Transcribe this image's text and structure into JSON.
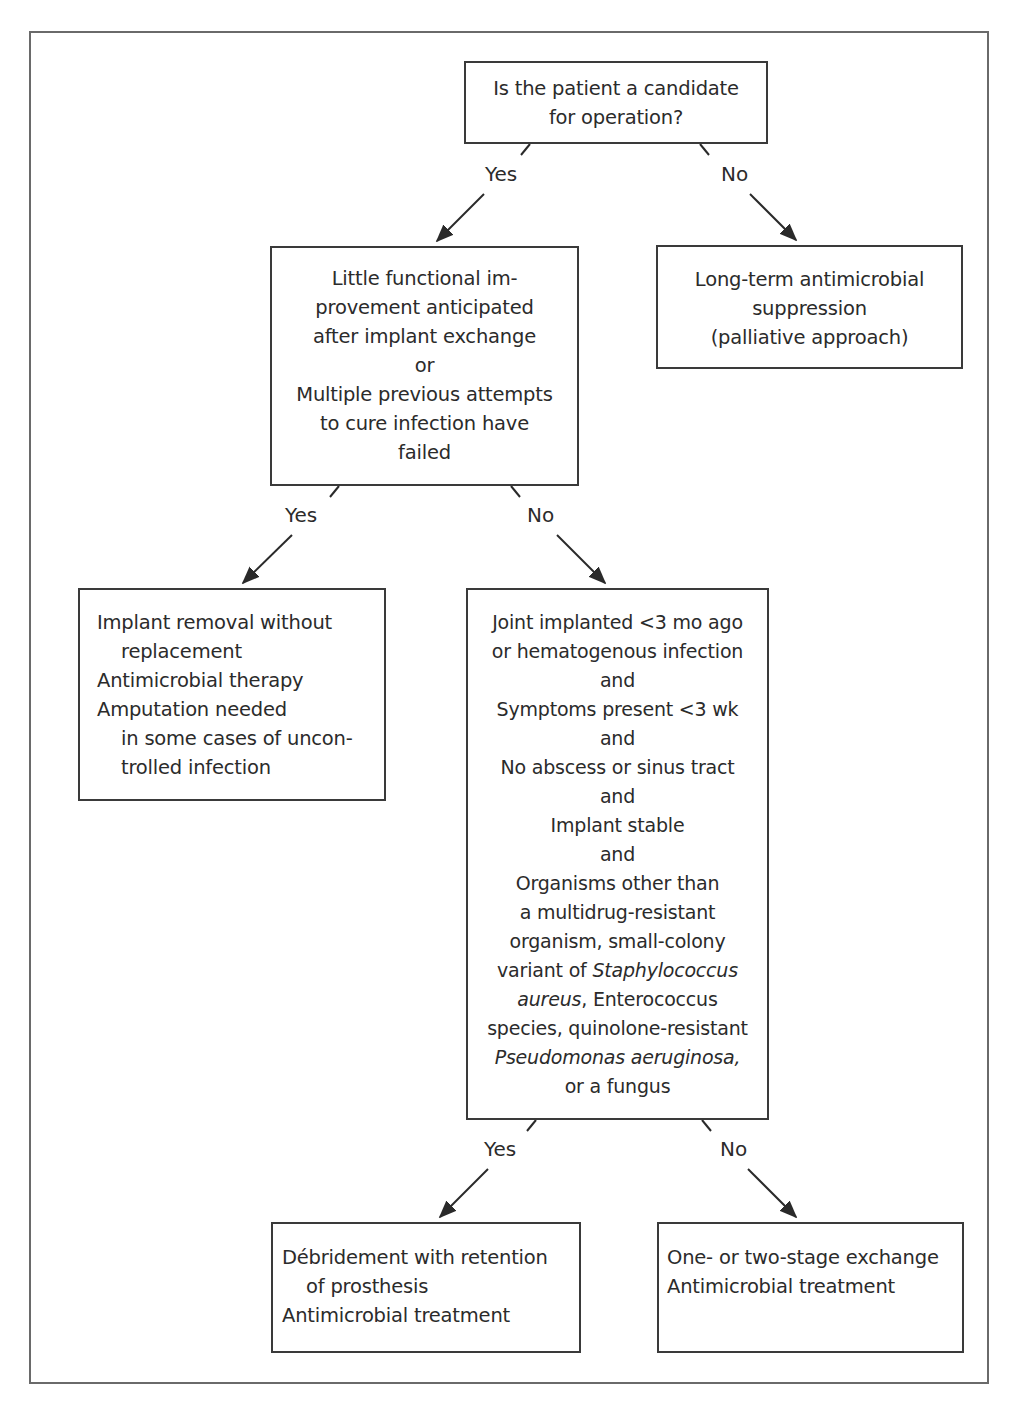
{
  "diagram": {
    "type": "decision-flowchart",
    "nodes": {
      "start": {
        "lines": [
          "Is the patient a candidate",
          "for operation?"
        ]
      },
      "functional": {
        "lines": [
          "Little functional im-",
          "provement anticipated",
          "after implant exchange",
          "or",
          "Multiple previous attempts",
          "to cure infection have",
          "failed"
        ]
      },
      "suppression": {
        "lines": [
          "Long-term antimicrobial",
          "suppression",
          "(palliative approach)"
        ]
      },
      "removal": {
        "lines": [
          "Implant removal without",
          "replacement",
          "Antimicrobial therapy",
          "Amputation needed",
          "in some cases of uncon-",
          "trolled infection"
        ]
      },
      "criteria": {
        "lines": [
          "Joint implanted <3 mo ago",
          "or hematogenous infection",
          "and",
          "Symptoms present <3 wk",
          "and",
          "No abscess or sinus tract",
          "and",
          "Implant stable",
          "and",
          "Organisms other than",
          "a multidrug-resistant",
          "organism, small-colony"
        ],
        "line_variant_pre": "variant of ",
        "line_variant_italic": "Staphylococcus",
        "line_aureus_italic": "aureus",
        "line_aureus_post": ", Enterococcus",
        "line_species": "species, quinolone-resistant",
        "line_pseudomonas_italic": "Pseudomonas aeruginosa,",
        "line_last": "or a fungus"
      },
      "debridement": {
        "lines": [
          "Débridement with retention",
          "of prosthesis",
          "Antimicrobial treatment"
        ]
      },
      "exchange": {
        "lines": [
          "One- or two-stage exchange",
          "Antimicrobial treatment"
        ]
      }
    },
    "edges": [
      {
        "from": "start",
        "to": "functional",
        "label": "Yes"
      },
      {
        "from": "start",
        "to": "suppression",
        "label": "No"
      },
      {
        "from": "functional",
        "to": "removal",
        "label": "Yes"
      },
      {
        "from": "functional",
        "to": "criteria",
        "label": "No"
      },
      {
        "from": "criteria",
        "to": "debridement",
        "label": "Yes"
      },
      {
        "from": "criteria",
        "to": "exchange",
        "label": "No"
      }
    ],
    "colors": {
      "stroke": "#3a3a3a",
      "frame": "#6a6a6a",
      "text": "#2b2b2b",
      "background": "#ffffff"
    }
  }
}
